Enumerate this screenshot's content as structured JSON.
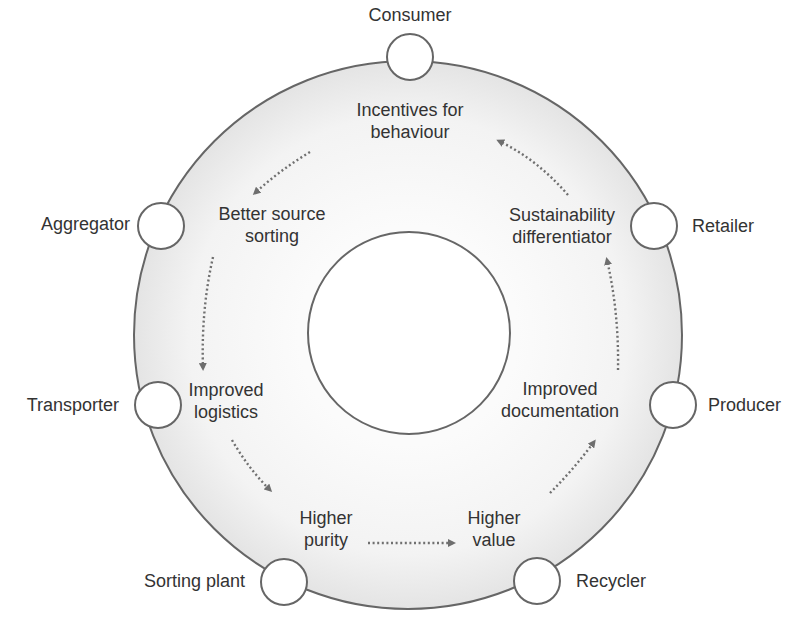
{
  "diagram": {
    "type": "circular-value-chain",
    "colors": {
      "ring_fill_outer": "#e9e9e9",
      "ring_fill_inner": "#fafafa",
      "stroke": "#666666",
      "arrow": "#707070",
      "text": "#333333"
    },
    "outer_ring": {
      "cx": 408,
      "cy": 335,
      "r": 274
    },
    "inner_circle": {
      "cx": 409,
      "cy": 333,
      "r": 101
    },
    "stakeholders": [
      {
        "id": "consumer",
        "label": "Consumer",
        "cx": 410,
        "cy": 57
      },
      {
        "id": "retailer",
        "label": "Retailer",
        "cx": 654,
        "cy": 226
      },
      {
        "id": "producer",
        "label": "Producer",
        "cx": 673,
        "cy": 405
      },
      {
        "id": "recycler",
        "label": "Recycler",
        "cx": 537,
        "cy": 581
      },
      {
        "id": "sorting-plant",
        "label": "Sorting plant",
        "cx": 284,
        "cy": 582
      },
      {
        "id": "transporter",
        "label": "Transporter",
        "cx": 158,
        "cy": 405
      },
      {
        "id": "aggregator",
        "label": "Aggregator",
        "cx": 161,
        "cy": 226
      }
    ],
    "benefits": [
      {
        "id": "incentives",
        "lines": [
          "Incentives for",
          "behaviour"
        ]
      },
      {
        "id": "better-sorting",
        "lines": [
          "Better source",
          "sorting"
        ]
      },
      {
        "id": "logistics",
        "lines": [
          "Improved",
          "logistics"
        ]
      },
      {
        "id": "purity",
        "lines": [
          "Higher",
          "purity"
        ]
      },
      {
        "id": "value",
        "lines": [
          "Higher",
          "value"
        ]
      },
      {
        "id": "documentation",
        "lines": [
          "Improved",
          "documentation"
        ]
      },
      {
        "id": "sustainability",
        "lines": [
          "Sustainability",
          "differentiator"
        ]
      }
    ],
    "flow": [
      {
        "from": "incentives",
        "to": "better-sorting"
      },
      {
        "from": "better-sorting",
        "to": "logistics"
      },
      {
        "from": "logistics",
        "to": "purity"
      },
      {
        "from": "purity",
        "to": "value"
      },
      {
        "from": "value",
        "to": "documentation"
      },
      {
        "from": "documentation",
        "to": "sustainability"
      },
      {
        "from": "sustainability",
        "to": "incentives"
      }
    ]
  }
}
